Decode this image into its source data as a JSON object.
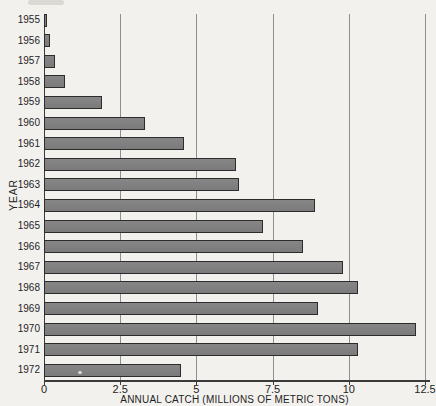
{
  "chart_data": {
    "type": "bar",
    "orientation": "horizontal",
    "title": "",
    "xlabel": "ANNUAL CATCH (MILLIONS OF METRIC TONS)",
    "ylabel": "YEAR",
    "categories": [
      "1955",
      "1956",
      "1957",
      "1958",
      "1959",
      "1960",
      "1961",
      "1962",
      "1963",
      "1964",
      "1965",
      "1966",
      "1967",
      "1968",
      "1969",
      "1970",
      "1971",
      "1972"
    ],
    "values": [
      0.1,
      0.2,
      0.35,
      0.7,
      1.9,
      3.3,
      4.6,
      6.3,
      6.4,
      8.9,
      7.2,
      8.5,
      9.8,
      10.3,
      9.0,
      12.2,
      10.3,
      4.5
    ],
    "xlim": [
      0,
      12.5
    ],
    "xticks": [
      0,
      2.5,
      5,
      7.5,
      10,
      12.5
    ],
    "xtick_labels": [
      "0",
      "2.5",
      "5",
      "7.5",
      "10",
      "12.5"
    ],
    "grid": true,
    "legend": false,
    "bar_color": "#808080",
    "bar_border_color": "#2c2c2c",
    "gridline_color": "#8e8e8e",
    "background_color": "#f3f1ee"
  }
}
